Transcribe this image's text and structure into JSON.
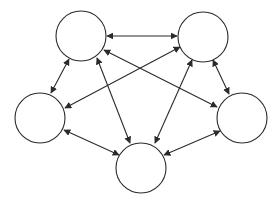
{
  "diagram": {
    "type": "complete-graph",
    "background": "#ffffff",
    "stroke_color": "#2b2b2b",
    "nodes": [
      {
        "id": "top-left",
        "cx": 81,
        "cy": 36,
        "r": 25,
        "label": ""
      },
      {
        "id": "top-right",
        "cx": 203,
        "cy": 37,
        "r": 25,
        "label": ""
      },
      {
        "id": "left",
        "cx": 40,
        "cy": 118,
        "r": 25,
        "label": ""
      },
      {
        "id": "right",
        "cx": 242,
        "cy": 118,
        "r": 25,
        "label": ""
      },
      {
        "id": "bottom",
        "cx": 141,
        "cy": 168,
        "r": 25,
        "label": ""
      }
    ],
    "edges": [
      {
        "from": "top-left",
        "to": "top-right",
        "direction": "both",
        "x1": 107,
        "y1": 36,
        "x2": 177,
        "y2": 36
      },
      {
        "from": "top-left",
        "to": "left",
        "direction": "both",
        "x1": 69,
        "y1": 59,
        "x2": 51,
        "y2": 93
      },
      {
        "from": "top-right",
        "to": "right",
        "direction": "both",
        "x1": 213,
        "y1": 60,
        "x2": 229,
        "y2": 94
      },
      {
        "from": "left",
        "to": "bottom",
        "direction": "both",
        "x1": 64,
        "y1": 130,
        "x2": 119,
        "y2": 155
      },
      {
        "from": "bottom",
        "to": "right",
        "direction": "both",
        "x1": 164,
        "y1": 155,
        "x2": 220,
        "y2": 131
      },
      {
        "from": "top-left",
        "to": "bottom",
        "direction": "both",
        "x1": 97,
        "y1": 58,
        "x2": 130,
        "y2": 143
      },
      {
        "from": "top-right",
        "to": "bottom",
        "direction": "both",
        "x1": 192,
        "y1": 60,
        "x2": 155,
        "y2": 143
      },
      {
        "from": "top-left",
        "to": "right",
        "direction": "both",
        "x1": 104,
        "y1": 50,
        "x2": 217,
        "y2": 107
      },
      {
        "from": "top-right",
        "to": "left",
        "direction": "both",
        "x1": 180,
        "y1": 47,
        "x2": 65,
        "y2": 108
      }
    ]
  }
}
